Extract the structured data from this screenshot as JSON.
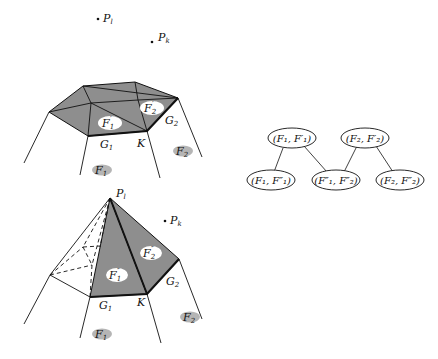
{
  "figure": {
    "top_panel": {
      "points": [
        {
          "label": "P",
          "sub": "l",
          "x": 98,
          "y": 19
        },
        {
          "label": "P",
          "sub": "k",
          "x": 152,
          "y": 42
        }
      ],
      "face_labels": {
        "F1prime": {
          "label": "F",
          "sub": "1",
          "prime": "′"
        },
        "F2prime": {
          "label": "F",
          "sub": "2",
          "prime": "′"
        },
        "F1": {
          "label": "F",
          "sub": "1"
        },
        "F2": {
          "label": "F",
          "sub": "2"
        }
      },
      "edge_labels": {
        "G1": {
          "label": "G",
          "sub": "1"
        },
        "G2": {
          "label": "G",
          "sub": "2"
        },
        "K": {
          "label": "K"
        }
      }
    },
    "bottom_panel": {
      "apex": {
        "label": "P",
        "sub": "l"
      },
      "point": {
        "label": "P",
        "sub": "k"
      },
      "face_labels": {
        "F1dprime": {
          "label": "F",
          "sub": "1",
          "prime": "″"
        },
        "F2dprime": {
          "label": "F",
          "sub": "2",
          "prime": "″"
        },
        "F1": {
          "label": "F",
          "sub": "1"
        },
        "F2": {
          "label": "F",
          "sub": "2"
        }
      },
      "edge_labels": {
        "G1": {
          "label": "G",
          "sub": "1"
        },
        "G2": {
          "label": "G",
          "sub": "2"
        },
        "K": {
          "label": "K"
        }
      }
    },
    "graph": {
      "nodes": [
        {
          "id": "n1",
          "text": "(F₁, F′₁)"
        },
        {
          "id": "n2",
          "text": "(F₂, F′₂)"
        },
        {
          "id": "n3",
          "text": "(F₁, F″₁)"
        },
        {
          "id": "n4",
          "text": "(F″₁, F″₂)"
        },
        {
          "id": "n5",
          "text": "(F₂, F″₂)"
        }
      ],
      "edges": [
        [
          "n1",
          "n3"
        ],
        [
          "n1",
          "n4"
        ],
        [
          "n2",
          "n4"
        ],
        [
          "n2",
          "n5"
        ]
      ]
    },
    "colors": {
      "shaded_face": "#8f8f8f",
      "dark_face": "#7c7c7c",
      "label_blob": "#b5b5b5",
      "stroke": "#111111"
    }
  }
}
